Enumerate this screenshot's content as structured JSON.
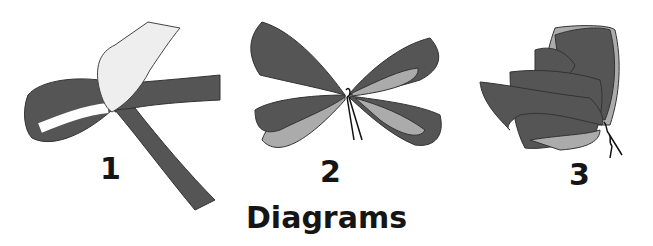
{
  "figure": {
    "title": "Diagrams",
    "steps": [
      {
        "label": "1",
        "description": "hand pinching ribbon loop"
      },
      {
        "label": "2",
        "description": "bow loops tied with wire"
      },
      {
        "label": "3",
        "description": "fluffed bow with twisted wire"
      }
    ]
  },
  "colors": {
    "ribbon_dark": "#555555",
    "ribbon_light": "#ababab",
    "outline": "#222222",
    "hand": "#eeeeee",
    "text": "#151515"
  }
}
